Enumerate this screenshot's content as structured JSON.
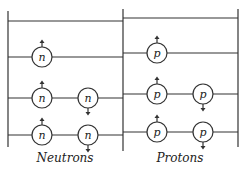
{
  "diagram": {
    "type": "nuclear-shell-levels",
    "panels": [
      {
        "name": "neutrons",
        "label": "Neutrons",
        "particle_symbol": "n",
        "levels": [
          {
            "level": 1,
            "particles": [
              {
                "spin": "up"
              },
              {
                "spin": "down"
              }
            ]
          },
          {
            "level": 2,
            "particles": [
              {
                "spin": "up"
              },
              {
                "spin": "down"
              }
            ]
          },
          {
            "level": 3,
            "particles": [
              {
                "spin": "up"
              }
            ]
          },
          {
            "level": 4,
            "particles": []
          }
        ]
      },
      {
        "name": "protons",
        "label": "Protons",
        "particle_symbol": "p",
        "levels": [
          {
            "level": 1,
            "particles": [
              {
                "spin": "up"
              },
              {
                "spin": "down"
              }
            ]
          },
          {
            "level": 2,
            "particles": [
              {
                "spin": "up"
              },
              {
                "spin": "down"
              }
            ]
          },
          {
            "level": 3,
            "particles": [
              {
                "spin": "up"
              }
            ]
          },
          {
            "level": 4,
            "particles": []
          }
        ]
      }
    ],
    "colors": {
      "line": "#333333",
      "background": "#ffffff"
    }
  }
}
